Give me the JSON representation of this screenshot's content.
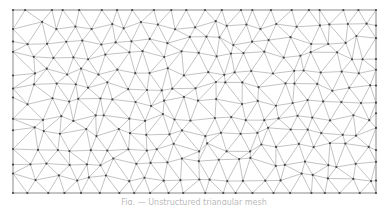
{
  "figure": {
    "type": "triangulated-mesh",
    "bounds": {
      "x0": 13,
      "y0": 10,
      "x1": 376,
      "y1": 193
    },
    "approx_spacing": 17,
    "seed": 7,
    "colors": {
      "edge": "#9a9a9a",
      "vertex": "#444444",
      "border": "#9a9a9a",
      "background": "#ffffff"
    },
    "edge_width": 0.6,
    "vertex_radius": 1.1
  },
  "caption": {
    "text": "Fig. — Unstructured triangular mesh"
  }
}
